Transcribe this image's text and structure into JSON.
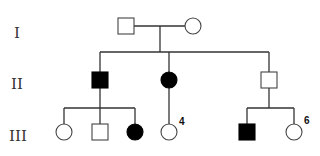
{
  "colors": {
    "affected": "#000000",
    "unaffected": "#ffffff",
    "line": "#333333"
  },
  "generations": [
    {
      "label": "I",
      "y": 33
    },
    {
      "label": "II",
      "y": 84
    },
    {
      "label": "III",
      "y": 136
    }
  ],
  "individuals": [
    {
      "id": "I-1",
      "sex": "male",
      "affected": false,
      "x": 126,
      "y": 26
    },
    {
      "id": "I-2",
      "sex": "female",
      "affected": false,
      "x": 193,
      "y": 26
    },
    {
      "id": "II-1",
      "sex": "male",
      "affected": true,
      "x": 100,
      "y": 80
    },
    {
      "id": "II-2",
      "sex": "female",
      "affected": true,
      "x": 169,
      "y": 80
    },
    {
      "id": "II-3",
      "sex": "male",
      "affected": false,
      "x": 269,
      "y": 80
    },
    {
      "id": "III-1",
      "sex": "female",
      "affected": false,
      "x": 64,
      "y": 132
    },
    {
      "id": "III-2",
      "sex": "male",
      "affected": false,
      "x": 100,
      "y": 132
    },
    {
      "id": "III-3",
      "sex": "female",
      "affected": true,
      "x": 135,
      "y": 132
    },
    {
      "id": "III-4",
      "sex": "female",
      "affected": false,
      "x": 169,
      "y": 132,
      "number_label": "4"
    },
    {
      "id": "III-5",
      "sex": "male",
      "affected": true,
      "x": 247,
      "y": 132
    },
    {
      "id": "III-6",
      "sex": "female",
      "affected": false,
      "x": 294,
      "y": 132,
      "number_label": "6"
    }
  ],
  "labels": {
    "four": "4",
    "six": "6"
  }
}
